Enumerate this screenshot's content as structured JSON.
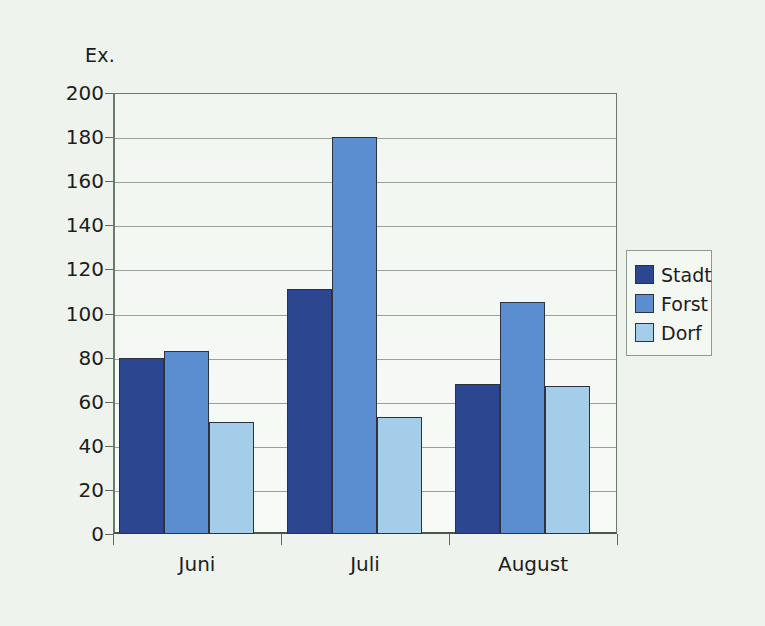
{
  "chart_data": {
    "type": "bar",
    "title": "",
    "subtitle": "",
    "xlabel": "",
    "ylabel": "Ex.",
    "categories": [
      "Juni",
      "Juli",
      "August"
    ],
    "series": [
      {
        "name": "Stadt",
        "color": "#2d4690",
        "values": [
          80,
          111,
          68
        ]
      },
      {
        "name": "Forst",
        "color": "#5b8ed0",
        "values": [
          83,
          180,
          105
        ]
      },
      {
        "name": "Dorf",
        "color": "#a3cde8",
        "values": [
          51,
          53,
          67
        ]
      }
    ],
    "ylim": [
      0,
      200
    ],
    "ytick_step": 20,
    "yticks": [
      200,
      180,
      160,
      140,
      120,
      100,
      80,
      60,
      40,
      20,
      0
    ],
    "ytick_labels": [
      "200",
      "180",
      "160",
      "140",
      "120",
      "100",
      "80",
      "60",
      "40",
      "20",
      "0"
    ],
    "grid": true,
    "grid_axis": "y",
    "legend_position": "right",
    "legend_entries": [
      "Stadt",
      "Forst",
      "Dorf"
    ],
    "annotations": [],
    "background_color": "#eef3ee",
    "plot_background_color": "#f4f8f3",
    "axis_color": "#6b7a6b",
    "bar_border_color": "#2b3340"
  }
}
